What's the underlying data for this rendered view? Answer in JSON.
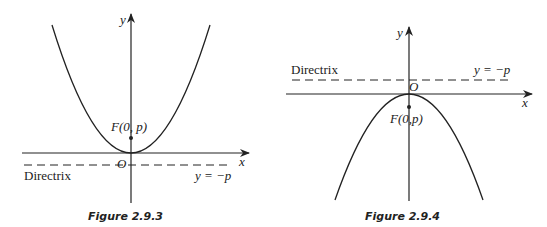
{
  "figures": [
    {
      "id": "fig-2-9-3",
      "caption": "Figure  2.9.3",
      "opens": "up",
      "y_axis_label": "y",
      "x_axis_label": "x",
      "origin_label": "O",
      "focus_label": "F(0, p)",
      "directrix_label": "Directrix",
      "directrix_equation": "y = −p"
    },
    {
      "id": "fig-2-9-4",
      "caption": "Figure  2.9.4",
      "opens": "down",
      "y_axis_label": "y",
      "x_axis_label": "x",
      "origin_label": "O",
      "focus_label": "F(0,p)",
      "directrix_label": "Directrix",
      "directrix_equation": "y = −p"
    }
  ],
  "colors": {
    "ink": "#222222",
    "background": "#ffffff"
  }
}
